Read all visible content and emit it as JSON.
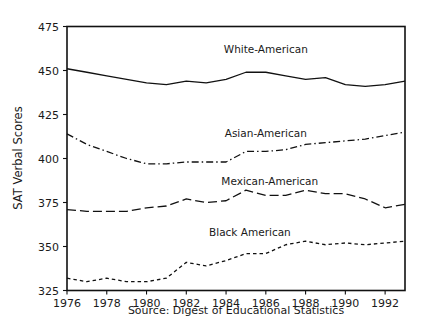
{
  "chart_data": {
    "type": "line",
    "title": "",
    "xlabel": "",
    "ylabel": "SAT Verbal Scores",
    "caption": "Source: Digest of Educational Statistics",
    "xlim": [
      1976,
      1993
    ],
    "ylim": [
      325,
      475
    ],
    "grid": false,
    "legend_position": "inline-labels",
    "x_ticks": [
      "1976",
      "1978",
      "1980",
      "1982",
      "1984",
      "1986",
      "1988",
      "1990",
      "1992"
    ],
    "x_tick_values": [
      1976,
      1978,
      1980,
      1982,
      1984,
      1986,
      1988,
      1990,
      1992
    ],
    "y_ticks": [
      "325",
      "350",
      "375",
      "400",
      "425",
      "450",
      "475"
    ],
    "y_tick_values": [
      325,
      350,
      375,
      400,
      425,
      450,
      475
    ],
    "x": [
      1976,
      1977,
      1978,
      1979,
      1980,
      1981,
      1982,
      1983,
      1984,
      1985,
      1986,
      1987,
      1988,
      1989,
      1990,
      1991,
      1992,
      1993
    ],
    "series": [
      {
        "name": "White-American",
        "label": "White-American",
        "style": "solid",
        "color": "#111111",
        "values": [
          451,
          449,
          447,
          445,
          443,
          442,
          444,
          443,
          445,
          449,
          449,
          447,
          445,
          446,
          442,
          441,
          442,
          444
        ]
      },
      {
        "name": "Asian-American",
        "label": "Asian-American",
        "style": "dash-dot",
        "color": "#111111",
        "values": [
          414,
          408,
          404,
          400,
          397,
          397,
          398,
          398,
          398,
          404,
          404,
          405,
          408,
          409,
          410,
          411,
          413,
          415
        ]
      },
      {
        "name": "Mexican-American",
        "label": "Mexican-American",
        "style": "long-dash",
        "color": "#111111",
        "values": [
          371,
          370,
          370,
          370,
          372,
          373,
          377,
          375,
          376,
          382,
          379,
          379,
          382,
          380,
          380,
          377,
          372,
          374
        ]
      },
      {
        "name": "Black American",
        "label": "Black American",
        "style": "short-dash",
        "color": "#111111",
        "values": [
          332,
          330,
          332,
          330,
          330,
          332,
          341,
          339,
          342,
          346,
          346,
          351,
          353,
          351,
          352,
          351,
          352,
          353
        ]
      }
    ],
    "series_label_positions": [
      {
        "name": "White-American",
        "x": 1986.0,
        "y": 460
      },
      {
        "name": "Asian-American",
        "x": 1986.0,
        "y": 412
      },
      {
        "name": "Mexican-American",
        "x": 1986.2,
        "y": 385
      },
      {
        "name": "Black American",
        "x": 1985.2,
        "y": 356
      }
    ]
  }
}
